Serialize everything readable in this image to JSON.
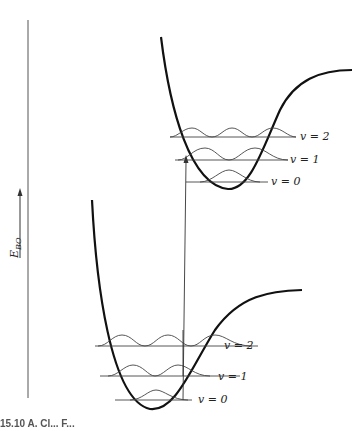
{
  "figure": {
    "axis_label": "E_BO",
    "axis_label_main": "E",
    "axis_label_sub": "BO",
    "excited_state": {
      "levels": [
        {
          "label": "v = 2"
        },
        {
          "label": "v = 1"
        },
        {
          "label": "v = 0"
        }
      ]
    },
    "ground_state": {
      "levels": [
        {
          "label": "v = 2"
        },
        {
          "label": "v = 1"
        },
        {
          "label": "v = 0"
        }
      ]
    },
    "caption_fragment": "15.10 A. Cl... F..."
  }
}
